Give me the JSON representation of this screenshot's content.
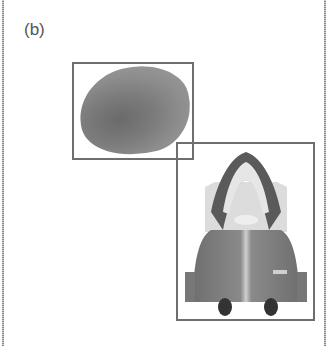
{
  "figure": {
    "panel_label": "(b)",
    "objects": [
      {
        "name": "potato",
        "bbox": [
          72,
          62,
          194,
          160
        ]
      },
      {
        "name": "vacuum-cleaner",
        "bbox": [
          176,
          142,
          315,
          321
        ]
      }
    ],
    "colors": {
      "box": "#6e6e6e",
      "background": "#ffffff"
    }
  }
}
